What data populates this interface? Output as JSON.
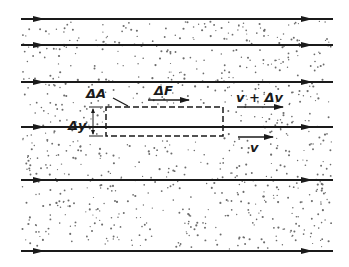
{
  "diagram": {
    "title": "",
    "colors": {
      "ink": "#1a1a1a",
      "background": "#ffffff",
      "dots": "#6b6b6b"
    },
    "streamlines": [
      {
        "y": 19,
        "x1": 21,
        "x2": 333
      },
      {
        "y": 45,
        "x1": 21,
        "x2": 333
      },
      {
        "y": 82,
        "x1": 21,
        "x2": 333
      },
      {
        "y": 127,
        "x1": 21,
        "x2": 333
      },
      {
        "y": 180,
        "x1": 21,
        "x2": 333
      },
      {
        "y": 251,
        "x1": 21,
        "x2": 333
      }
    ],
    "element_box": {
      "x": 106,
      "y": 107,
      "width": 117,
      "height": 29,
      "style": "dashed"
    },
    "labels": {
      "area": "ΔA",
      "force": "ΔF",
      "thickness": "Δy",
      "upper_velocity": "v + Δv",
      "lower_velocity": "v"
    },
    "vectors": {
      "force_arrow": {
        "x1": 148,
        "x2": 189,
        "y": 100
      },
      "upper_velocity_arrow": {
        "x1": 237,
        "x2": 283,
        "y": 107
      },
      "lower_velocity_arrow": {
        "x1": 238,
        "x2": 273,
        "y": 137
      }
    }
  }
}
